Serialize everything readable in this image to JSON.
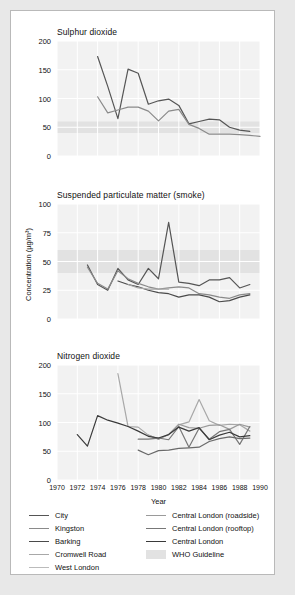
{
  "figure": {
    "outer_bg": "#e8e8e8",
    "card_bg": "#ffffff",
    "plot_bg": "#f2f2f2",
    "grid_color": "#ffffff",
    "band_color": "#e2e2e2"
  },
  "axis": {
    "xlabel": "Year",
    "ylabel": "Concentration (µg/m³)",
    "xticks": [
      "1970",
      "1972",
      "1974",
      "1976",
      "1978",
      "1980",
      "1982",
      "1984",
      "1986",
      "1988",
      "1990"
    ],
    "xlim": [
      1970,
      1990
    ]
  },
  "legend": {
    "left": [
      {
        "label": "City",
        "color": "#555555"
      },
      {
        "label": "Kingston",
        "color": "#8a8a8a"
      },
      {
        "label": "Barking",
        "color": "#4a4a4a"
      },
      {
        "label": "Cromwell Road",
        "color": "#a8a8a8"
      },
      {
        "label": "West London",
        "color": "#bbbbbb"
      }
    ],
    "right": [
      {
        "label": "Central London (roadside)",
        "color": "#9a9a9a"
      },
      {
        "label": "Central London (rooftop)",
        "color": "#777777"
      },
      {
        "label": "Central London",
        "color": "#3a3a3a"
      },
      {
        "label": "WHO Guideline",
        "color": "#e2e2e2",
        "type": "band"
      }
    ]
  },
  "chart_data": [
    {
      "type": "line",
      "title": "Sulphur dioxide",
      "xlabel": "Year",
      "ylabel": "Concentration (µg/m³)",
      "xlim": [
        1970,
        1990
      ],
      "ylim": [
        0,
        200
      ],
      "yticks": [
        0,
        50,
        100,
        150,
        200
      ],
      "grid": true,
      "who_guideline_band": [
        40,
        60
      ],
      "series": [
        {
          "name": "City",
          "color": "#555555",
          "x": [
            1974,
            1975,
            1976,
            1977,
            1978,
            1979,
            1980,
            1981,
            1982,
            1983,
            1984,
            1985,
            1986,
            1987,
            1988,
            1989
          ],
          "values": [
            173,
            121,
            65,
            151,
            144,
            90,
            96,
            99,
            88,
            56,
            60,
            64,
            63,
            50,
            45,
            43
          ]
        },
        {
          "name": "Kingston",
          "color": "#8a8a8a",
          "x": [
            1974,
            1975,
            1976,
            1977,
            1978,
            1979,
            1980,
            1981,
            1982,
            1983,
            1984,
            1985,
            1986,
            1987,
            1988,
            1989,
            1990
          ],
          "values": [
            103,
            75,
            80,
            85,
            85,
            78,
            61,
            78,
            81,
            55,
            48,
            38,
            38,
            38,
            37,
            36,
            34
          ]
        }
      ]
    },
    {
      "type": "line",
      "title": "Suspended particulate matter (smoke)",
      "xlabel": "Year",
      "ylabel": "Concentration (µg/m³)",
      "xlim": [
        1970,
        1990
      ],
      "ylim": [
        0,
        100
      ],
      "yticks": [
        0,
        25,
        50,
        75,
        100
      ],
      "grid": true,
      "who_guideline_band": [
        40,
        60
      ],
      "series": [
        {
          "name": "City",
          "color": "#555555",
          "x": [
            1973,
            1974,
            1975,
            1976,
            1977,
            1978,
            1979,
            1980,
            1981,
            1982,
            1983,
            1984,
            1985,
            1986,
            1987,
            1988,
            1989
          ],
          "values": [
            47,
            30,
            25,
            44,
            34,
            30,
            44,
            35,
            84,
            32,
            31,
            29,
            34,
            34,
            36,
            27,
            30
          ]
        },
        {
          "name": "Kingston",
          "color": "#8a8a8a",
          "x": [
            1973,
            1974,
            1975,
            1976,
            1977,
            1978,
            1979,
            1980,
            1981,
            1982,
            1983,
            1984,
            1985,
            1986,
            1987,
            1988,
            1989
          ],
          "values": [
            45,
            31,
            26,
            42,
            35,
            31,
            28,
            26,
            27,
            28,
            27,
            22,
            21,
            19,
            18,
            21,
            22
          ]
        },
        {
          "name": "Barking",
          "color": "#4a4a4a",
          "x": [
            1976,
            1977,
            1978,
            1979,
            1980,
            1981,
            1982,
            1983,
            1984,
            1985,
            1986,
            1987,
            1988,
            1989
          ],
          "values": [
            33,
            30,
            28,
            25,
            23,
            22,
            19,
            21,
            21,
            19,
            15,
            16,
            19,
            21
          ]
        },
        {
          "name": "Cromwell Road",
          "color": "#a8a8a8",
          "x": [
            1977,
            1978,
            1979,
            1980,
            1981
          ],
          "values": [
            30,
            27,
            26,
            26,
            26
          ]
        }
      ]
    },
    {
      "type": "line",
      "title": "Nitrogen dioxide",
      "xlabel": "Year",
      "ylabel": "Concentration (µg/m³)",
      "xlim": [
        1970,
        1990
      ],
      "ylim": [
        0,
        200
      ],
      "yticks": [
        0,
        50,
        100,
        150,
        200
      ],
      "grid": true,
      "who_guideline_band": null,
      "series": [
        {
          "name": "Cromwell Road",
          "color": "#a8a8a8",
          "x": [
            1976,
            1977,
            1978,
            1979,
            1980,
            1981,
            1982,
            1983,
            1984,
            1985,
            1986,
            1987,
            1988,
            1989
          ],
          "values": [
            185,
            93,
            92,
            78,
            71,
            79,
            96,
            101,
            140,
            103,
            95,
            97,
            96,
            85
          ]
        },
        {
          "name": "Central London (roadside)",
          "color": "#9a9a9a",
          "x": [
            1979,
            1980,
            1981,
            1982,
            1983,
            1984,
            1985,
            1986,
            1987,
            1988,
            1989
          ],
          "values": [
            78,
            71,
            79,
            97,
            91,
            90,
            95,
            96,
            88,
            97,
            92
          ]
        },
        {
          "name": "Central London (rooftop)",
          "color": "#777777",
          "x": [
            1978,
            1979,
            1980,
            1981,
            1982,
            1983,
            1984,
            1985,
            1986,
            1987,
            1988,
            1989
          ],
          "values": [
            71,
            71,
            73,
            70,
            93,
            57,
            90,
            71,
            84,
            88,
            62,
            93
          ]
        },
        {
          "name": "Central London",
          "color": "#3a3a3a",
          "x": [
            1972,
            1973,
            1974,
            1975,
            1976,
            1977,
            1978,
            1979,
            1980,
            1981,
            1982,
            1983,
            1984,
            1985,
            1986,
            1987,
            1988,
            1989
          ],
          "values": [
            79,
            59,
            112,
            104,
            99,
            93,
            85,
            76,
            73,
            79,
            92,
            85,
            91,
            70,
            78,
            83,
            75,
            77
          ]
        },
        {
          "name": "Barking",
          "color": "#6a6a6a",
          "x": [
            1978,
            1979,
            1980,
            1981,
            1982,
            1983,
            1984,
            1985,
            1986,
            1987,
            1988,
            1989
          ],
          "values": [
            52,
            44,
            51,
            52,
            55,
            56,
            57,
            67,
            72,
            75,
            72,
            73
          ]
        }
      ]
    }
  ]
}
